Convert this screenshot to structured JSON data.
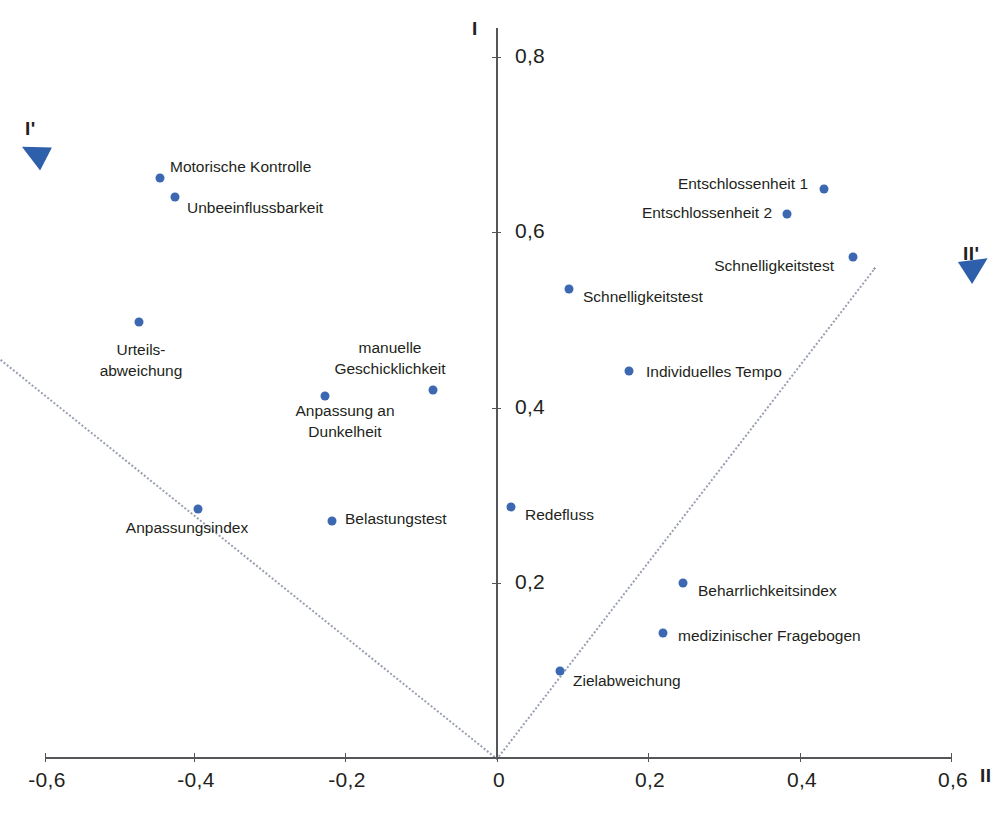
{
  "chart_data": {
    "type": "scatter",
    "title": "",
    "xlabel": "II",
    "ylabel": "I",
    "xlim": [
      -0.66,
      0.66
    ],
    "ylim": [
      -0.02,
      0.86
    ],
    "grid": false,
    "legend": "none",
    "xticks": [
      "-0,6",
      "-0,4",
      "-0,2",
      "0",
      "0,2",
      "0,4",
      "0,6"
    ],
    "xtick_values": [
      -0.6,
      -0.4,
      -0.2,
      0,
      0.2,
      0.4,
      0.6
    ],
    "yticks": [
      "0,2",
      "0,4",
      "0,6",
      "0,8"
    ],
    "ytick_values": [
      0.2,
      0.4,
      0.6,
      0.8
    ],
    "rotated_axes": [
      {
        "name": "I'",
        "label": "I'",
        "angle_deg": 153,
        "direction": "upper-left"
      },
      {
        "name": "II'",
        "label": "II'",
        "angle_deg": 33,
        "direction": "upper-right"
      }
    ],
    "points": [
      {
        "label": "Motorische Kontrolle",
        "x": -0.445,
        "y": 0.662,
        "anchor": "right",
        "px": 160,
        "py": 178,
        "lx": 170,
        "ly": 167
      },
      {
        "label": "Unbeeinflussbarkeit",
        "x": -0.425,
        "y": 0.641,
        "anchor": "right",
        "px": 175,
        "py": 197,
        "lx": 187,
        "ly": 208
      },
      {
        "label": "Urteils-\nabweichung",
        "x": -0.474,
        "y": 0.499,
        "anchor": "center",
        "px": 139,
        "py": 322,
        "lx": 141,
        "ly": 361
      },
      {
        "label": "manuelle\nGeschicklichkeit",
        "x": -0.085,
        "y": 0.42,
        "anchor": "center",
        "px": 433,
        "py": 390,
        "lx": 390,
        "ly": 359
      },
      {
        "label": "Anpassung an\nDunkelheit",
        "x": -0.228,
        "y": 0.414,
        "anchor": "center",
        "px": 325,
        "py": 396,
        "lx": 345,
        "ly": 422
      },
      {
        "label": "Anpassungsindex",
        "x": -0.395,
        "y": 0.285,
        "anchor": "center",
        "px": 198,
        "py": 509,
        "lx": 187,
        "ly": 528
      },
      {
        "label": "Belastungstest",
        "x": -0.218,
        "y": 0.271,
        "anchor": "right",
        "px": 332,
        "py": 521,
        "lx": 345,
        "ly": 519
      },
      {
        "label": "Entschlossenheit 1",
        "x": 0.432,
        "y": 0.65,
        "anchor": "left",
        "px": 824,
        "py": 189,
        "lx": 808,
        "ly": 184
      },
      {
        "label": "Entschlossenheit 2",
        "x": 0.383,
        "y": 0.622,
        "anchor": "left",
        "px": 787,
        "py": 214,
        "lx": 772,
        "ly": 213
      },
      {
        "label": "Schnelligkeitstest",
        "x": 0.47,
        "y": 0.573,
        "anchor": "left",
        "px": 853,
        "py": 257,
        "lx": 834,
        "ly": 266
      },
      {
        "label": "Schnelligkeitstest",
        "x": 0.095,
        "y": 0.536,
        "anchor": "right",
        "px": 569,
        "py": 289,
        "lx": 583,
        "ly": 297
      },
      {
        "label": "Individuelles Tempo",
        "x": 0.175,
        "y": 0.442,
        "anchor": "right",
        "px": 629,
        "py": 371,
        "lx": 646,
        "ly": 372
      },
      {
        "label": "Redefluss",
        "x": 0.019,
        "y": 0.287,
        "anchor": "right",
        "px": 511,
        "py": 507,
        "lx": 525,
        "ly": 515
      },
      {
        "label": "Beharrlichkeitsindex",
        "x": 0.246,
        "y": 0.2,
        "anchor": "right",
        "px": 683,
        "py": 583,
        "lx": 698,
        "ly": 591
      },
      {
        "label": "medizinischer Fragebogen",
        "x": 0.219,
        "y": 0.143,
        "anchor": "right",
        "px": 663,
        "py": 633,
        "lx": 678,
        "ly": 636
      },
      {
        "label": "Zielabweichung",
        "x": 0.083,
        "y": 0.1,
        "anchor": "right",
        "px": 560,
        "py": 671,
        "lx": 573,
        "ly": 681
      }
    ],
    "colors": {
      "point": "#3b68b0",
      "arrow": "#2d5faa",
      "guide_line": "#98a0b0",
      "axis": "#54565a",
      "text": "#231f20",
      "background": "#ffffff"
    }
  },
  "axes": {
    "x_name": "II",
    "y_name": "I",
    "x_rot_name": "II'",
    "y_rot_name": "I'"
  }
}
